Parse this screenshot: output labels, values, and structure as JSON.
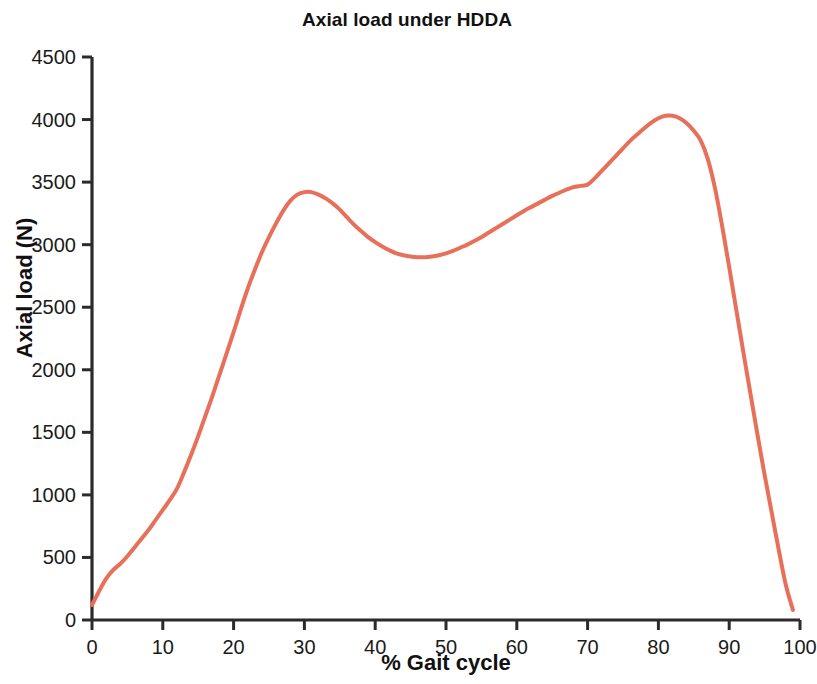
{
  "chart_data": {
    "type": "line",
    "title": "Axial load under HDDA",
    "xlabel": "% Gait cycle",
    "ylabel": "Axial load (N)",
    "xlim": [
      0,
      100
    ],
    "ylim": [
      0,
      4500
    ],
    "xticks": [
      0,
      10,
      20,
      30,
      40,
      50,
      60,
      70,
      80,
      90,
      100
    ],
    "yticks": [
      0,
      500,
      1000,
      1500,
      2000,
      2500,
      3000,
      3500,
      4000,
      4500
    ],
    "grid": false,
    "legend": false,
    "spines": [
      "left",
      "bottom"
    ],
    "series": [
      {
        "name": "Axial load under HDDA",
        "color": "#E8705A",
        "line_width": 4,
        "x": [
          0,
          1,
          2,
          3,
          4,
          5,
          6,
          7,
          8,
          9,
          10,
          11,
          12,
          13,
          14,
          15,
          16,
          17,
          18,
          19,
          20,
          21,
          22,
          23,
          24,
          25,
          26,
          27,
          28,
          29,
          30,
          31,
          32,
          33,
          34,
          35,
          36,
          37,
          38,
          39,
          40,
          41,
          42,
          43,
          44,
          45,
          46,
          47,
          48,
          49,
          50,
          51,
          52,
          53,
          54,
          55,
          56,
          57,
          58,
          59,
          60,
          61,
          62,
          63,
          64,
          65,
          66,
          67,
          68,
          69,
          70,
          71,
          72,
          73,
          74,
          75,
          76,
          77,
          78,
          79,
          80,
          81,
          82,
          83,
          84,
          85,
          86,
          87,
          88,
          89,
          90,
          91,
          92,
          93,
          94,
          95,
          96,
          97,
          98,
          99
        ],
        "y": [
          120,
          230,
          330,
          400,
          450,
          510,
          580,
          650,
          720,
          800,
          880,
          960,
          1050,
          1180,
          1320,
          1470,
          1630,
          1790,
          1960,
          2130,
          2300,
          2480,
          2650,
          2800,
          2940,
          3060,
          3170,
          3270,
          3350,
          3400,
          3420,
          3420,
          3400,
          3370,
          3330,
          3280,
          3220,
          3160,
          3110,
          3060,
          3020,
          2985,
          2955,
          2930,
          2915,
          2905,
          2900,
          2900,
          2905,
          2915,
          2930,
          2950,
          2975,
          3000,
          3030,
          3060,
          3095,
          3130,
          3165,
          3200,
          3235,
          3270,
          3300,
          3330,
          3360,
          3390,
          3415,
          3440,
          3460,
          3470,
          3480,
          3530,
          3590,
          3650,
          3710,
          3770,
          3830,
          3880,
          3930,
          3975,
          4010,
          4030,
          4030,
          4010,
          3970,
          3910,
          3830,
          3680,
          3450,
          3150,
          2820,
          2480,
          2140,
          1810,
          1480,
          1160,
          860,
          560,
          280,
          80
        ]
      }
    ],
    "notable_points": {
      "start": {
        "x": 0,
        "y": 120
      },
      "first_peak": {
        "x": 31,
        "y": 3420
      },
      "mid_valley": {
        "x": 47,
        "y": 2900
      },
      "shoulder": {
        "x": 70,
        "y": 3480
      },
      "second_peak": {
        "x": 81.5,
        "y": 4030
      },
      "end": {
        "x": 99,
        "y": 80
      }
    }
  },
  "axes": {
    "title": "Axial load under HDDA",
    "x_axis_label": "% Gait cycle",
    "y_axis_label": "Axial load (N)",
    "x_tick_labels": [
      "0",
      "10",
      "20",
      "30",
      "40",
      "50",
      "60",
      "70",
      "80",
      "90",
      "100"
    ],
    "y_tick_labels": [
      "0",
      "500",
      "1000",
      "1500",
      "2000",
      "2500",
      "3000",
      "3500",
      "4000",
      "4500"
    ]
  },
  "style": {
    "line_color": "#E8705A",
    "axis_color": "#2b2b2b",
    "text_color": "#111111",
    "background": "#ffffff"
  }
}
